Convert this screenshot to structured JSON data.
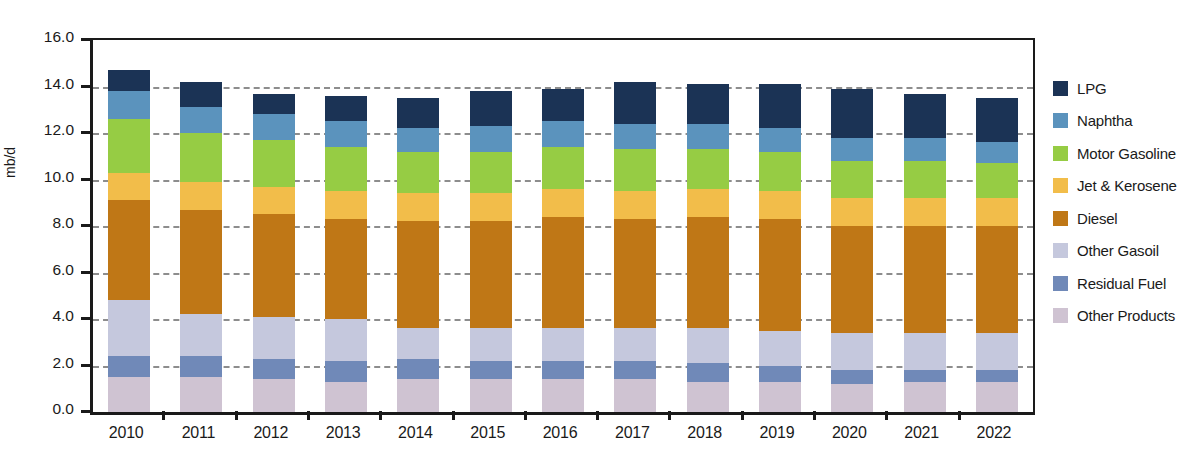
{
  "title": "",
  "yaxis": {
    "label": "mb/d",
    "ticks": [
      "16.0",
      "14.0",
      "12.0",
      "10.0",
      "8.0",
      "6.0",
      "4.0",
      "2.0",
      "0.0"
    ],
    "min": 0.0,
    "max": 16.0,
    "step": 2.0
  },
  "legend": [
    {
      "label": "LPG",
      "color": "#1b3355"
    },
    {
      "label": "Naphtha",
      "color": "#5b93bd"
    },
    {
      "label": "Motor Gasoline",
      "color": "#96cc44"
    },
    {
      "label": "Jet & Kerosene",
      "color": "#f2bd4a"
    },
    {
      "label": "Diesel",
      "color": "#bf7716"
    },
    {
      "label": "Other Gasoil",
      "color": "#c5c8dd"
    },
    {
      "label": "Residual Fuel",
      "color": "#7089b8"
    },
    {
      "label": "Other Products",
      "color": "#cfc3d2"
    }
  ],
  "chart_data": {
    "type": "bar",
    "stacked": true,
    "title": "",
    "xlabel": "",
    "ylabel": "mb/d",
    "ylim": [
      0.0,
      16.0
    ],
    "ytick_step": 2.0,
    "grid": true,
    "legend_position": "right",
    "categories": [
      "2010",
      "2011",
      "2012",
      "2013",
      "2014",
      "2015",
      "2016",
      "2017",
      "2018",
      "2019",
      "2020",
      "2021",
      "2022"
    ],
    "series": [
      {
        "name": "Other Products",
        "color": "#cfc3d2",
        "values": [
          1.5,
          1.5,
          1.4,
          1.3,
          1.4,
          1.4,
          1.4,
          1.4,
          1.3,
          1.3,
          1.2,
          1.3,
          1.3
        ]
      },
      {
        "name": "Residual Fuel",
        "color": "#7089b8",
        "values": [
          0.9,
          0.9,
          0.9,
          0.9,
          0.9,
          0.8,
          0.8,
          0.8,
          0.8,
          0.7,
          0.6,
          0.5,
          0.5
        ]
      },
      {
        "name": "Other Gasoil",
        "color": "#c5c8dd",
        "values": [
          2.4,
          1.8,
          1.8,
          1.8,
          1.3,
          1.4,
          1.4,
          1.4,
          1.5,
          1.5,
          1.6,
          1.6,
          1.6
        ]
      },
      {
        "name": "Diesel",
        "color": "#bf7716",
        "values": [
          4.3,
          4.5,
          4.4,
          4.3,
          4.6,
          4.6,
          4.8,
          4.7,
          4.8,
          4.8,
          4.6,
          4.6,
          4.6
        ]
      },
      {
        "name": "Jet & Kerosene",
        "color": "#f2bd4a",
        "values": [
          1.2,
          1.2,
          1.2,
          1.2,
          1.2,
          1.2,
          1.2,
          1.2,
          1.2,
          1.2,
          1.2,
          1.2,
          1.2
        ]
      },
      {
        "name": "Motor Gasoline",
        "color": "#96cc44",
        "values": [
          2.3,
          2.1,
          2.0,
          1.9,
          1.8,
          1.8,
          1.8,
          1.8,
          1.7,
          1.7,
          1.6,
          1.6,
          1.5
        ]
      },
      {
        "name": "Naphtha",
        "color": "#5b93bd",
        "values": [
          1.2,
          1.1,
          1.1,
          1.1,
          1.0,
          1.1,
          1.1,
          1.1,
          1.1,
          1.0,
          1.0,
          1.0,
          0.9
        ]
      },
      {
        "name": "LPG",
        "color": "#1b3355",
        "values": [
          0.9,
          1.1,
          0.9,
          1.1,
          1.3,
          1.5,
          1.4,
          1.8,
          1.7,
          1.9,
          2.1,
          1.9,
          1.9
        ]
      }
    ],
    "totals": [
      14.7,
      14.2,
      13.7,
      13.6,
      13.5,
      13.8,
      13.9,
      14.2,
      14.1,
      14.1,
      13.9,
      13.7,
      13.5
    ]
  }
}
